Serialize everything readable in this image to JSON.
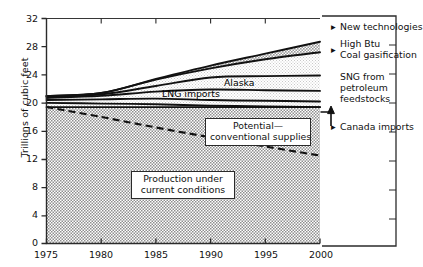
{
  "chart_data": {
    "type": "area",
    "title": "",
    "subtitle": "",
    "xlabel": "",
    "ylabel": "Trillions of cubic feet",
    "xlim": [
      1975,
      2000
    ],
    "ylim": [
      0,
      32
    ],
    "grid": false,
    "legend_position": "right-outside",
    "x_ticks": [
      "1975",
      "1980",
      "1985",
      "1990",
      "1995",
      "2000"
    ],
    "x_tick_values": [
      1975,
      1980,
      1985,
      1990,
      1995,
      2000
    ],
    "y_ticks": [
      "0",
      "4",
      "8",
      "12",
      "16",
      "20",
      "24",
      "28",
      "32"
    ],
    "y_tick_values": [
      0,
      4,
      8,
      12,
      16,
      20,
      24,
      28,
      32
    ],
    "x": [
      1975,
      1980,
      1985,
      1990,
      1995,
      2000
    ],
    "stacked_boundaries": [
      {
        "name": "Production under current conditions (top)",
        "values": [
          19.4,
          19.4,
          19.4,
          19.4,
          19.4,
          19.4
        ],
        "fill": "hatch-dark"
      },
      {
        "name": "Canada imports (top)",
        "values": [
          20.0,
          19.9,
          19.8,
          19.6,
          19.5,
          19.4
        ],
        "fill": "hatch-light"
      },
      {
        "name": "SNG from petroleum feedstocks (top)",
        "values": [
          20.4,
          20.5,
          20.6,
          20.4,
          20.3,
          20.2
        ],
        "fill": "hatch-light"
      },
      {
        "name": "LNG imports (top)",
        "values": [
          20.7,
          21.0,
          21.6,
          21.9,
          21.8,
          21.7
        ],
        "fill": "hatch-light"
      },
      {
        "name": "Alaska (top)",
        "values": [
          20.9,
          21.2,
          22.4,
          23.6,
          23.8,
          23.9
        ],
        "fill": "hatch-light"
      },
      {
        "name": "High Btu Coal gasification (top)",
        "values": [
          21.0,
          21.4,
          23.3,
          24.9,
          26.2,
          27.2
        ],
        "fill": "hatch-light"
      },
      {
        "name": "New technologies (top)",
        "values": [
          21.0,
          21.4,
          23.4,
          25.3,
          27.0,
          28.7
        ],
        "fill": "hatch-mid"
      }
    ],
    "dashed_line": {
      "name": "Potential—conventional supplies",
      "values": [
        19.4,
        18.0,
        16.5,
        15.1,
        13.8,
        12.5
      ],
      "style": "dashed"
    },
    "series": [
      {
        "name": "Production under current conditions",
        "values": [
          19.4,
          19.4,
          19.4,
          19.4,
          19.4,
          19.4
        ]
      },
      {
        "name": "Canada imports",
        "values": [
          0.6,
          0.5,
          0.4,
          0.2,
          0.1,
          0.0
        ]
      },
      {
        "name": "SNG from petroleum feedstocks",
        "values": [
          0.4,
          0.6,
          0.8,
          0.8,
          0.8,
          0.8
        ]
      },
      {
        "name": "LNG imports",
        "values": [
          0.3,
          0.5,
          1.0,
          1.5,
          1.5,
          1.5
        ]
      },
      {
        "name": "Alaska",
        "values": [
          0.2,
          0.2,
          0.8,
          1.7,
          2.0,
          2.2
        ]
      },
      {
        "name": "High Btu Coal gasification",
        "values": [
          0.1,
          0.2,
          0.9,
          1.3,
          2.4,
          3.3
        ]
      },
      {
        "name": "New technologies",
        "values": [
          0.0,
          0.0,
          0.1,
          0.4,
          0.8,
          1.5
        ]
      }
    ],
    "annotations": [
      {
        "text": "Alaska",
        "x": 1992.5,
        "y": 22.8,
        "boxed": false
      },
      {
        "text": "LNG imports",
        "x": 1987.0,
        "y": 21.0,
        "boxed": false
      },
      {
        "text": "Potential—\nconventional supplies",
        "x": 1993.5,
        "y": 17.5,
        "boxed": true
      },
      {
        "text": "Production under\ncurrent conditions",
        "x": 1986.0,
        "y": 10.0,
        "boxed": true
      }
    ]
  },
  "axes": {
    "y_title": "Trillions of cubic feet",
    "y_ticks": [
      "32",
      "28",
      "24",
      "20",
      "16",
      "12",
      "8",
      "4",
      "0"
    ],
    "x_ticks": [
      "1975",
      "1980",
      "1985",
      "1990",
      "1995",
      "2000"
    ]
  },
  "plot_labels": {
    "alaska": "Alaska",
    "lng_imports": "LNG imports",
    "potential_line1": "Potential—",
    "potential_line2": "conventional supplies",
    "production_line1": "Production under",
    "production_line2": "current conditions"
  },
  "right_labels": {
    "new_technologies": "New technologies",
    "high_btu_line1": "High Btu",
    "high_btu_line2": "Coal gasification",
    "sng_line1": "SNG from",
    "sng_line2": "petroleum",
    "sng_line3": "feedstocks",
    "canada_imports": "Canada imports"
  },
  "colors": {
    "ink": "#1a1a1a",
    "fill_light": "#d9d9d9",
    "fill_mid": "#9e9e9e",
    "fill_dark": "#b4b4b4",
    "background": "#ffffff"
  }
}
